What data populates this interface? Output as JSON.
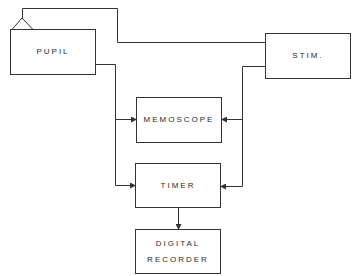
{
  "diagram": {
    "type": "block-diagram",
    "blocks": [
      {
        "id": "pupil",
        "label": "PUPIL"
      },
      {
        "id": "stim",
        "label": "STIM."
      },
      {
        "id": "memoscope",
        "label": "MEMOSCOPE"
      },
      {
        "id": "timer",
        "label": "TIMER"
      },
      {
        "id": "recorder",
        "label_line1": "DIGITAL",
        "label_line2": "RECORDER"
      }
    ],
    "connections": [
      {
        "from": "pupil",
        "to": "stim",
        "note": "line from sensor triangle atop PUPIL to STIM"
      },
      {
        "from": "pupil",
        "to": "memoscope"
      },
      {
        "from": "pupil",
        "to": "timer"
      },
      {
        "from": "stim",
        "to": "memoscope"
      },
      {
        "from": "stim",
        "to": "timer"
      },
      {
        "from": "timer",
        "to": "recorder"
      }
    ],
    "line_color": "#333333"
  }
}
